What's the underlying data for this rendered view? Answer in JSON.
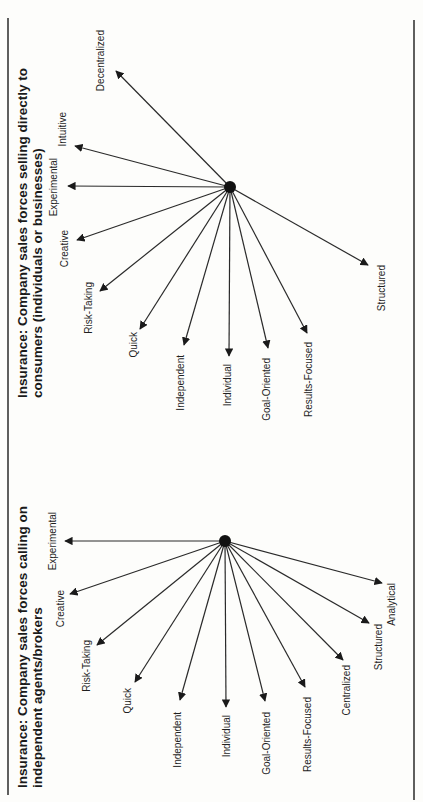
{
  "page": {
    "orientation": "rotated-90-ccw",
    "background": "#fdfdfb",
    "ink": "#1a1a1a"
  },
  "diagrams": [
    {
      "title_line1": "Insurance: Company sales forces selling directly to",
      "title_line2": "consumers (individuals or businesses)",
      "hub": {
        "x": 230,
        "y": 187
      },
      "arrows": [
        {
          "label": "Decentralized",
          "tip": [
            116,
            71
          ],
          "text": [
            104,
            30
          ]
        },
        {
          "label": "Intuitive",
          "tip": [
            75,
            146
          ],
          "text": [
            66,
            112
          ]
        },
        {
          "label": "Experimental",
          "tip": [
            68,
            186
          ],
          "text": [
            57,
            158
          ]
        },
        {
          "label": "Creative",
          "tip": [
            77,
            240
          ],
          "text": [
            68,
            230
          ]
        },
        {
          "label": "Risk-Taking",
          "tip": [
            100,
            291
          ],
          "text": [
            92,
            282
          ]
        },
        {
          "label": "Quick",
          "tip": [
            140,
            329
          ],
          "text": [
            137,
            332
          ]
        },
        {
          "label": "Independent",
          "tip": [
            184,
            345
          ],
          "text": [
            184,
            355
          ]
        },
        {
          "label": "Individual",
          "tip": [
            229,
            356
          ],
          "text": [
            231,
            364
          ]
        },
        {
          "label": "Goal-Oriented",
          "tip": [
            268,
            348
          ],
          "text": [
            270,
            358
          ]
        },
        {
          "label": "Results-Focused",
          "tip": [
            307,
            333
          ],
          "text": [
            312,
            342
          ]
        },
        {
          "label": "Structured",
          "tip": [
            368,
            265
          ],
          "text": [
            385,
            265
          ]
        }
      ]
    },
    {
      "title_line1": "Insurance: Company sales forces calling on",
      "title_line2": "independent agents/brokers",
      "hub": {
        "x": 225,
        "y": 541
      },
      "arrows": [
        {
          "label": "Experimental",
          "tip": [
            65,
            541
          ],
          "text": [
            56,
            512
          ]
        },
        {
          "label": "Creative",
          "tip": [
            70,
            594
          ],
          "text": [
            64,
            590
          ]
        },
        {
          "label": "Risk-Taking",
          "tip": [
            97,
            645
          ],
          "text": [
            90,
            640
          ]
        },
        {
          "label": "Quick",
          "tip": [
            135,
            682
          ],
          "text": [
            131,
            688
          ]
        },
        {
          "label": "Independent",
          "tip": [
            180,
            700
          ],
          "text": [
            181,
            712
          ]
        },
        {
          "label": "Individual",
          "tip": [
            226,
            707
          ],
          "text": [
            230,
            715
          ]
        },
        {
          "label": "Goal-Oriented",
          "tip": [
            265,
            701
          ],
          "text": [
            270,
            712
          ]
        },
        {
          "label": "Results-Focused",
          "tip": [
            305,
            687
          ],
          "text": [
            311,
            697
          ]
        },
        {
          "label": "Centralized",
          "tip": [
            343,
            660
          ],
          "text": [
            350,
            665
          ]
        },
        {
          "label": "Structured",
          "tip": [
            369,
            623
          ],
          "text": [
            382,
            624
          ]
        },
        {
          "label": "Analytical",
          "tip": [
            382,
            583
          ],
          "text": [
            395,
            583
          ]
        }
      ]
    }
  ],
  "rules": {
    "left": {
      "x": 8,
      "y1": 18,
      "y2": 795
    },
    "right": {
      "x": 414,
      "y1": 20,
      "y2": 800
    }
  }
}
